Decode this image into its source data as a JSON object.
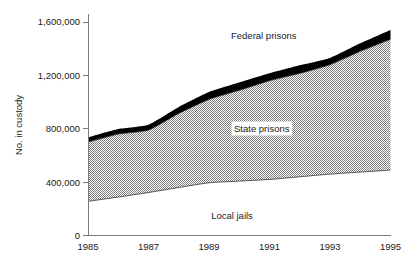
{
  "chart_data": {
    "type": "area",
    "title": "",
    "subtitle": "",
    "xlabel": "",
    "ylabel": "No. in custody",
    "stacked": true,
    "grid": false,
    "legend_position": "inline-annotations",
    "xlim": [
      1985,
      1995
    ],
    "ylim": [
      0,
      1600000
    ],
    "x": [
      1985,
      1986,
      1987,
      1988,
      1989,
      1990,
      1991,
      1992,
      1993,
      1994,
      1995
    ],
    "x_tick_labels": [
      "1985",
      "1987",
      "1989",
      "1991",
      "1993",
      "1995"
    ],
    "x_ticks": [
      1985,
      1987,
      1989,
      1991,
      1993,
      1995
    ],
    "y_tick_labels": [
      "0",
      "400,000",
      "800,000",
      "1,200,000",
      "1,600,000"
    ],
    "y_ticks": [
      0,
      400000,
      800000,
      1200000,
      1600000
    ],
    "series": [
      {
        "name": "Local jails",
        "label": "Local jails",
        "fill": "white",
        "values": [
          256000,
          288000,
          322000,
          360000,
          395000,
          408000,
          420000,
          440000,
          460000,
          475000,
          490000
        ]
      },
      {
        "name": "State prisons",
        "label": "State prisons",
        "fill": "gray-dither",
        "values": [
          444000,
          472000,
          468000,
          555000,
          625000,
          680000,
          740000,
          775000,
          820000,
          905000,
          980000
        ]
      },
      {
        "name": "Federal prisons",
        "label": "Federal prisons",
        "fill": "black",
        "values": [
          35000,
          38000,
          40000,
          48000,
          55000,
          58000,
          55000,
          60000,
          50000,
          60000,
          70000
        ]
      }
    ],
    "cumulative_tops": {
      "local_jails": [
        256000,
        288000,
        322000,
        360000,
        395000,
        408000,
        420000,
        440000,
        460000,
        475000,
        490000
      ],
      "state_prisons_top": [
        700000,
        760000,
        790000,
        915000,
        1020000,
        1088000,
        1160000,
        1215000,
        1280000,
        1380000,
        1470000
      ],
      "federal_prisons_top": [
        735000,
        798000,
        830000,
        963000,
        1075000,
        1146000,
        1215000,
        1275000,
        1330000,
        1440000,
        1540000
      ]
    },
    "annotations": [
      {
        "text": "Federal prisons",
        "x": 1990.3,
        "y": 1520000
      },
      {
        "text": "State prisons",
        "x": 1990.3,
        "y": 840000
      },
      {
        "text": "Local jails",
        "x": 1989.6,
        "y": 175000
      }
    ]
  }
}
